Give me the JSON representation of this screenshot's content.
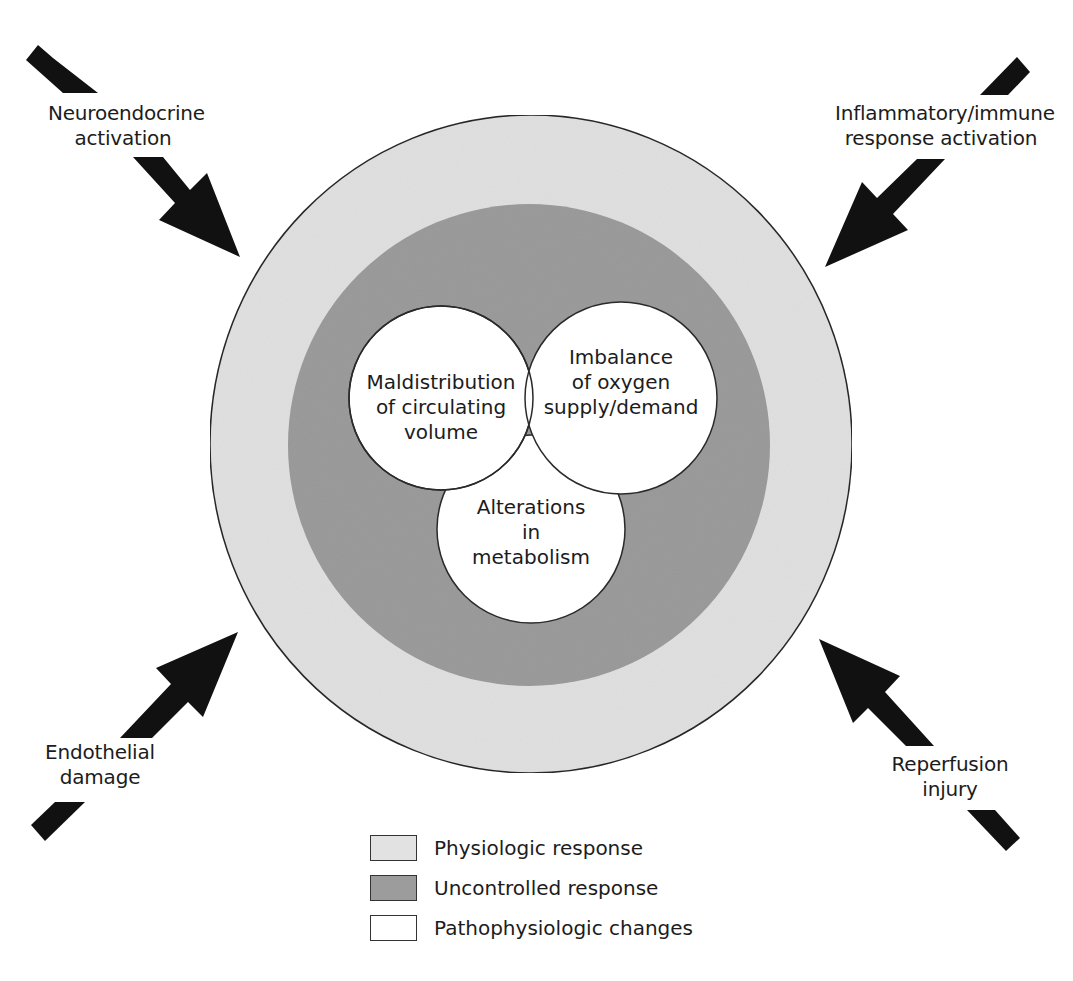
{
  "colors": {
    "background": "#ffffff",
    "physiologic": "#e2e2e2",
    "uncontrolled": "#9c9c9c",
    "pathophysiologic": "#ffffff",
    "outline": "#2a2a2a",
    "arrow": "#111111",
    "text": "#1c1c1c"
  },
  "stimuli": {
    "top_left": {
      "line1": "Neuroendocrine",
      "line2": "activation",
      "arrow_direction": "inward-down-right"
    },
    "top_right": {
      "line1": "Inflammatory/immune",
      "line2": "response activation",
      "arrow_direction": "inward-down-left"
    },
    "bottom_left": {
      "line1": "Endothelial",
      "line2": "damage",
      "arrow_direction": "inward-up-right"
    },
    "bottom_right": {
      "line1": "Reperfusion",
      "line2": "injury",
      "arrow_direction": "inward-up-left"
    }
  },
  "rings": {
    "outer": {
      "name": "Physiologic response",
      "cx": 531,
      "cy": 444,
      "rx": 321,
      "ry": 329
    },
    "middle": {
      "name": "Uncontrolled response",
      "cx": 529,
      "cy": 445,
      "r": 240
    }
  },
  "inner_circles": [
    {
      "id": "maldistribution",
      "lines": [
        "Maldistribution",
        "of circulating",
        "volume"
      ],
      "cx": 441,
      "cy": 398,
      "r": 92
    },
    {
      "id": "imbalance",
      "lines": [
        "Imbalance",
        "of oxygen",
        "supply/demand"
      ],
      "cx": 621,
      "cy": 398,
      "r": 96
    },
    {
      "id": "alterations",
      "lines": [
        "Alterations",
        "in",
        "metabolism"
      ],
      "cx": 531,
      "cy": 529,
      "r": 94
    }
  ],
  "legend": {
    "items": [
      {
        "label": "Physiologic response",
        "swatch": "#e2e2e2"
      },
      {
        "label": "Uncontrolled response",
        "swatch": "#9c9c9c"
      },
      {
        "label": "Pathophysiologic changes",
        "swatch": "#ffffff"
      }
    ]
  }
}
